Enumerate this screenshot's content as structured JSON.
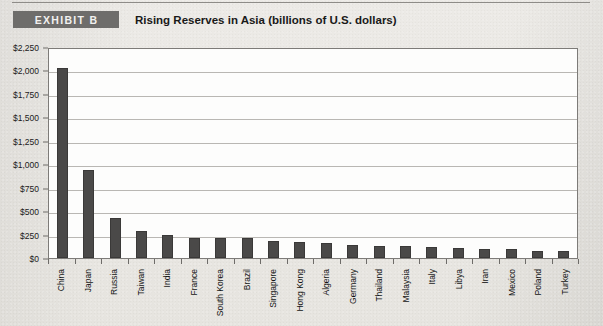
{
  "header": {
    "badge_label": "EXHIBIT B",
    "title": "Rising Reserves in Asia (billions of U.S. dollars)"
  },
  "colors": {
    "bar": "#4a4948",
    "badge_bg": "#6e6d6b",
    "plot_bg": "#fdfdfc",
    "gridline": "#b9b7b3",
    "page_bg": "#e8e7e3"
  },
  "chart_data": {
    "type": "bar",
    "title": "Rising Reserves in Asia (billions of U.S. dollars)",
    "xlabel": "",
    "ylabel": "",
    "ylim": [
      0,
      2250
    ],
    "ytick_step": 250,
    "ytick_labels": [
      "$2,250",
      "$2,000",
      "$1,750",
      "$1,500",
      "$1,250",
      "$1,000",
      "$750",
      "$500",
      "$250",
      "$0"
    ],
    "ytick_values": [
      2250,
      2000,
      1750,
      1500,
      1250,
      1000,
      750,
      500,
      250,
      0
    ],
    "grid": true,
    "legend": "none",
    "categories": [
      "China",
      "Japan",
      "Russia",
      "Taiwan",
      "India",
      "France",
      "South Korea",
      "Brazil",
      "Singapore",
      "Hong Kong",
      "Algeria",
      "Germany",
      "Thailand",
      "Malaysia",
      "Italy",
      "Libya",
      "Iran",
      "Mexico",
      "Poland",
      "Turkey"
    ],
    "values": [
      2030,
      940,
      430,
      290,
      250,
      215,
      210,
      210,
      180,
      175,
      160,
      135,
      130,
      125,
      120,
      110,
      100,
      95,
      80,
      70
    ]
  }
}
